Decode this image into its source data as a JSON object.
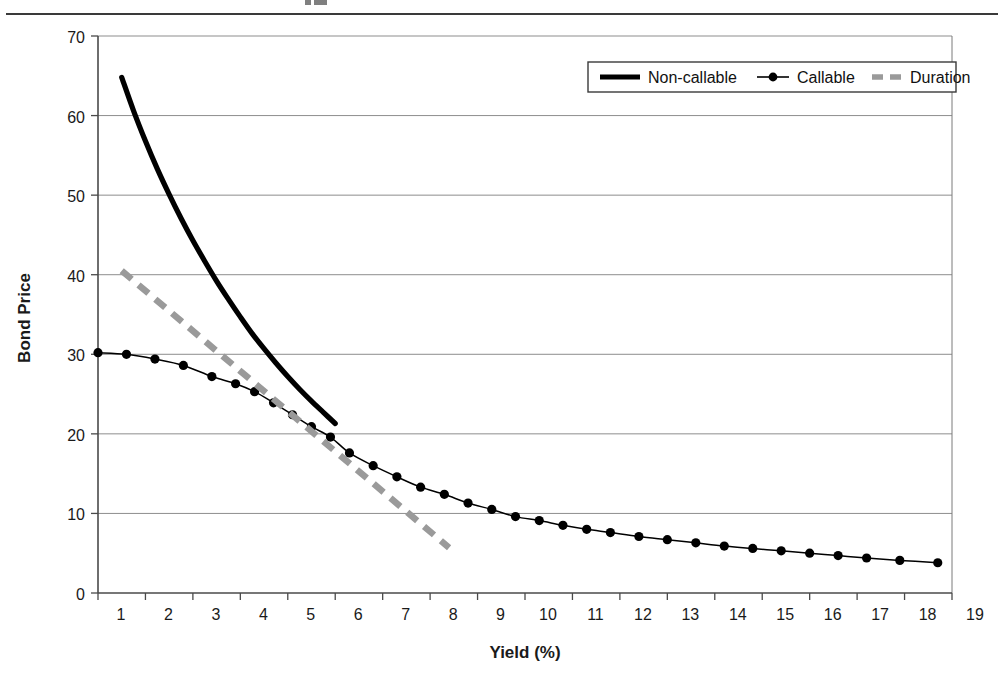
{
  "page": {
    "header_rule": true,
    "background": "#ffffff"
  },
  "chart_data": {
    "type": "line",
    "title": "",
    "xlabel": "Yield (%)",
    "ylabel": "Bond Price",
    "xlim": [
      1,
      19
    ],
    "ylim": [
      0,
      70
    ],
    "xticks": [
      1,
      2,
      3,
      4,
      5,
      6,
      7,
      8,
      9,
      10,
      11,
      12,
      13,
      14,
      15,
      16,
      17,
      18,
      19
    ],
    "yticks": [
      0,
      10,
      20,
      30,
      40,
      50,
      60,
      70
    ],
    "grid": "horizontal",
    "legend_position": "top-right",
    "series": [
      {
        "name": "Non-callable",
        "style": "thick-solid",
        "color": "#000000",
        "marker": "none",
        "x": [
          1.5,
          1.75,
          2.0,
          2.25,
          2.5,
          2.75,
          3.0,
          3.25,
          3.5,
          3.75,
          4.0,
          4.25,
          4.5,
          4.75,
          5.0,
          5.25,
          5.5,
          5.75,
          6.0
        ],
        "y": [
          64.8,
          60.6,
          56.8,
          53.3,
          50.1,
          47.1,
          44.3,
          41.7,
          39.2,
          36.9,
          34.7,
          32.6,
          30.7,
          28.9,
          27.2,
          25.6,
          24.1,
          22.7,
          21.3
        ]
      },
      {
        "name": "Callable",
        "style": "thin-solid-marker",
        "color": "#000000",
        "marker": "circle",
        "x": [
          1.0,
          1.6,
          2.2,
          2.8,
          3.4,
          3.9,
          4.3,
          4.7,
          5.1,
          5.5,
          5.9,
          6.3,
          6.8,
          7.3,
          7.8,
          8.3,
          8.8,
          9.3,
          9.8,
          10.3,
          10.8,
          11.3,
          11.8,
          12.4,
          13.0,
          13.6,
          14.2,
          14.8,
          15.4,
          16.0,
          16.6,
          17.2,
          17.9,
          18.7
        ],
        "y": [
          30.2,
          30.0,
          29.4,
          28.6,
          27.2,
          26.3,
          25.3,
          23.9,
          22.4,
          20.9,
          19.6,
          17.6,
          16.0,
          14.6,
          13.3,
          12.4,
          11.3,
          10.5,
          9.6,
          9.1,
          8.5,
          8.0,
          7.6,
          7.1,
          6.7,
          6.3,
          5.9,
          5.6,
          5.3,
          5.0,
          4.7,
          4.4,
          4.1,
          3.8
        ]
      },
      {
        "name": "Duration",
        "style": "thick-dashed",
        "color": "#9a9a9a",
        "marker": "none",
        "x": [
          1.5,
          8.4
        ],
        "y": [
          40.5,
          5.7
        ]
      }
    ],
    "legend": [
      {
        "label": "Non-callable",
        "swatch": "thick-solid-black"
      },
      {
        "label": "Callable",
        "swatch": "thin-solid-black-dot"
      },
      {
        "label": "Duration",
        "swatch": "thick-dashed-gray"
      }
    ]
  }
}
